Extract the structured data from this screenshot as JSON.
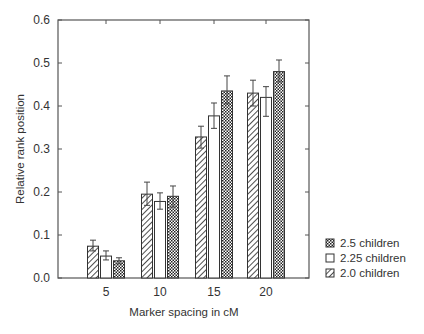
{
  "chart_data": {
    "type": "bar",
    "title": "",
    "xlabel": "Marker spacing in cM",
    "ylabel": "Relative rank position",
    "categories": [
      "5",
      "10",
      "15",
      "20"
    ],
    "ylim": [
      0.0,
      0.6
    ],
    "yticks": [
      "0.0",
      "0.1",
      "0.2",
      "0.3",
      "0.4",
      "0.5",
      "0.6"
    ],
    "ytick_values": [
      0.0,
      0.1,
      0.2,
      0.3,
      0.4,
      0.5,
      0.6
    ],
    "grid": false,
    "legend_position": "right-bottom",
    "series": [
      {
        "name": "2.0 children",
        "pattern": "diagonal-hatch",
        "values": [
          0.074,
          0.195,
          0.328,
          0.43
        ],
        "error_low": [
          0.063,
          0.169,
          0.302,
          0.4
        ],
        "error_high": [
          0.088,
          0.223,
          0.353,
          0.46
        ]
      },
      {
        "name": "2.25 children",
        "pattern": "open",
        "values": [
          0.051,
          0.178,
          0.377,
          0.42
        ],
        "error_low": [
          0.042,
          0.16,
          0.348,
          0.376
        ],
        "error_high": [
          0.063,
          0.198,
          0.407,
          0.445
        ]
      },
      {
        "name": "2.5 children",
        "pattern": "checkered",
        "values": [
          0.04,
          0.19,
          0.435,
          0.48
        ],
        "error_low": [
          0.033,
          0.165,
          0.405,
          0.456
        ],
        "error_high": [
          0.047,
          0.214,
          0.47,
          0.507
        ]
      }
    ],
    "legend_order": [
      "2.5 children",
      "2.25 children",
      "2.0 children"
    ]
  }
}
